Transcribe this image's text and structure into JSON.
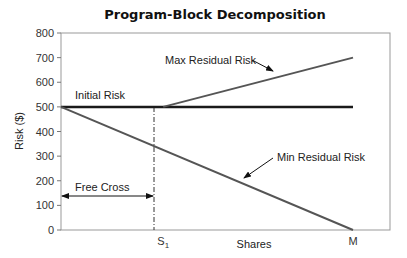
{
  "chart_data": {
    "type": "line",
    "title": "Program-Block Decomposition",
    "xlabel": "Shares",
    "ylabel": "Risk ($)",
    "ylim": [
      0,
      800
    ],
    "yticks": [
      0,
      100,
      200,
      300,
      400,
      500,
      600,
      700,
      800
    ],
    "xticks": [
      {
        "label": "S",
        "sub": "1",
        "pos": 0.35
      },
      {
        "label": "M",
        "sub": "",
        "pos": 1.0
      }
    ],
    "grid": false,
    "legend": "none",
    "series": [
      {
        "name": "Initial Risk",
        "points": [
          [
            0,
            500
          ],
          [
            1.0,
            500
          ]
        ],
        "color": "#1a1a1a",
        "width": 2.5
      },
      {
        "name": "Max Residual Risk",
        "points": [
          [
            0.35,
            500
          ],
          [
            1.0,
            700
          ]
        ],
        "color": "#555555",
        "width": 2
      },
      {
        "name": "Min Residual Risk",
        "points": [
          [
            0,
            500
          ],
          [
            1.0,
            0
          ]
        ],
        "color": "#555555",
        "width": 2
      }
    ],
    "annotations": [
      {
        "text": "Initial Risk"
      },
      {
        "text": "Max Residual Risk",
        "arrow": true
      },
      {
        "text": "Min Residual Risk",
        "arrow": true
      },
      {
        "text": "Free Cross",
        "double_arrow_from": 0,
        "double_arrow_to": 0.35,
        "y": 140
      },
      {
        "dashed_vertical_at": 0.35,
        "from": 0,
        "to": 500
      }
    ]
  }
}
